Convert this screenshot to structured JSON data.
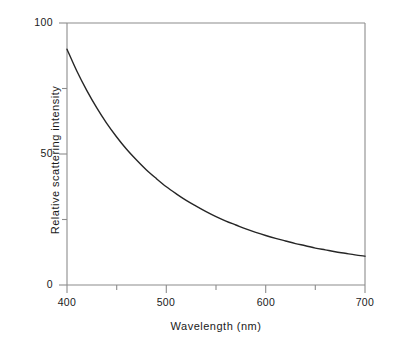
{
  "chart_data": {
    "type": "line",
    "title": "",
    "subtitle": "",
    "xlabel": "Wavelength (nm)",
    "ylabel": "Relative scattering intensity",
    "xlim": [
      400,
      700
    ],
    "ylim": [
      0,
      100
    ],
    "grid": false,
    "legend": "none",
    "x_major_ticks": [
      400,
      500,
      600,
      700
    ],
    "x_minor_ticks": [
      450,
      550,
      650
    ],
    "y_major_ticks": [
      0,
      50,
      100
    ],
    "y_minor_ticks": [
      25,
      75
    ],
    "x_tick_labels": [
      "400",
      "500",
      "600",
      "700"
    ],
    "y_tick_labels": [
      "0",
      "50",
      "100"
    ],
    "series": [
      {
        "name": "Rayleigh scattering",
        "color": "#262626",
        "x": [
          400,
          410,
          420,
          430,
          440,
          450,
          460,
          470,
          480,
          490,
          500,
          510,
          520,
          530,
          540,
          550,
          560,
          570,
          580,
          590,
          600,
          610,
          620,
          630,
          640,
          650,
          660,
          670,
          680,
          690,
          700
        ],
        "y": [
          90.0,
          81.6,
          74.2,
          67.6,
          61.7,
          56.5,
          51.8,
          47.7,
          43.9,
          40.6,
          37.5,
          34.8,
          32.3,
          30.1,
          28.0,
          26.1,
          24.4,
          22.9,
          21.4,
          20.1,
          18.9,
          17.8,
          16.8,
          15.8,
          15.0,
          14.1,
          13.4,
          12.7,
          12.1,
          11.5,
          11.0
        ]
      }
    ],
    "annotations": []
  },
  "axes": {
    "x_label": "Wavelength (nm)",
    "y_label": "Relative scattering intensity",
    "x_tick_labels": [
      "400",
      "500",
      "600",
      "700"
    ],
    "y_tick_labels": [
      "0",
      "50",
      "100"
    ]
  },
  "colors": {
    "curve": "#262626",
    "frame": "#8c8c8c",
    "tick": "#8c8c8c",
    "text": "#1a1a1a",
    "background": "#ffffff"
  }
}
